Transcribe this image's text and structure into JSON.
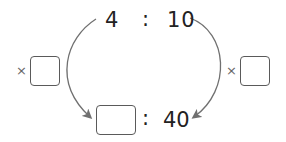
{
  "ratio_top": {
    "left": "4",
    "separator": ":",
    "right": "10"
  },
  "ratio_bottom": {
    "left": "",
    "separator": ":",
    "right": "40"
  },
  "multiplier_left": {
    "symbol": "×",
    "value": ""
  },
  "multiplier_right": {
    "symbol": "×",
    "value": ""
  },
  "colors": {
    "arrow": "#707070",
    "text": "#222222",
    "box_border": "#5a5a5a"
  }
}
